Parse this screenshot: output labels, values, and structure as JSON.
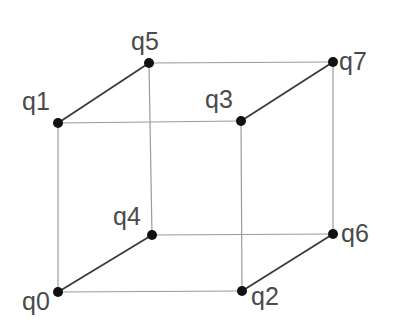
{
  "diagram": {
    "type": "cube-graph",
    "colors": {
      "edge_thin": "#9a9a9a",
      "edge_diagonal": "#3a3a3a",
      "node": "#111111",
      "label": "#4a4a4a",
      "background": "#ffffff"
    },
    "nodes": [
      {
        "id": "q0",
        "label": "q0",
        "x": 58,
        "y": 292,
        "lx": 22,
        "ly": 310
      },
      {
        "id": "q1",
        "label": "q1",
        "x": 58,
        "y": 123,
        "lx": 22,
        "ly": 110
      },
      {
        "id": "q2",
        "label": "q2",
        "x": 242,
        "y": 291,
        "lx": 251,
        "ly": 305
      },
      {
        "id": "q3",
        "label": "q3",
        "x": 241,
        "y": 121,
        "lx": 205,
        "ly": 108
      },
      {
        "id": "q4",
        "label": "q4",
        "x": 152,
        "y": 235,
        "lx": 113,
        "ly": 225
      },
      {
        "id": "q5",
        "label": "q5",
        "x": 149,
        "y": 63,
        "lx": 131,
        "ly": 50
      },
      {
        "id": "q6",
        "label": "q6",
        "x": 333,
        "y": 234,
        "lx": 341,
        "ly": 242
      },
      {
        "id": "q7",
        "label": "q7",
        "x": 333,
        "y": 62,
        "lx": 339,
        "ly": 70
      }
    ],
    "edges": [
      {
        "from": "q1",
        "to": "q5",
        "style": "diagonal"
      },
      {
        "from": "q3",
        "to": "q7",
        "style": "diagonal"
      },
      {
        "from": "q0",
        "to": "q4",
        "style": "diagonal"
      },
      {
        "from": "q2",
        "to": "q6",
        "style": "diagonal"
      },
      {
        "from": "q5",
        "to": "q7",
        "style": "thin"
      },
      {
        "from": "q1",
        "to": "q3",
        "style": "thin"
      },
      {
        "from": "q4",
        "to": "q6",
        "style": "thin"
      },
      {
        "from": "q0",
        "to": "q2",
        "style": "thin"
      },
      {
        "from": "q1",
        "to": "q0",
        "style": "thin"
      },
      {
        "from": "q5",
        "to": "q4",
        "style": "thin"
      },
      {
        "from": "q3",
        "to": "q2",
        "style": "thin"
      },
      {
        "from": "q7",
        "to": "q6",
        "style": "thin"
      }
    ]
  }
}
